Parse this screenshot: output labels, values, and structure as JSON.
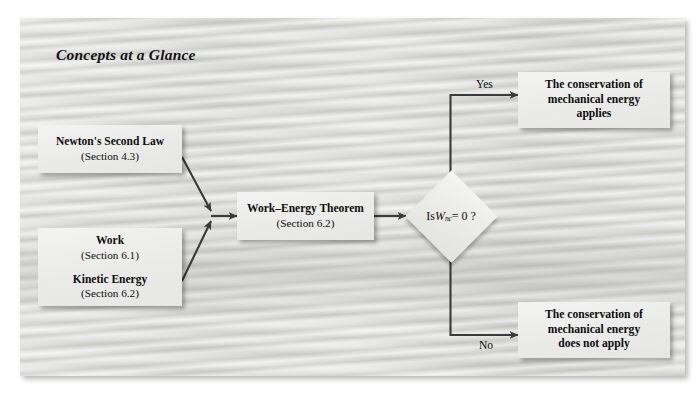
{
  "figure": {
    "title": "Concepts at a Glance",
    "background_color": "#d7d7d4",
    "node_fill_color": "#efefed",
    "line_color": "#3a3a3a"
  },
  "nodes": {
    "newtons_second_law": {
      "heading": "Newton's Second Law",
      "section": "(Section 4.3)"
    },
    "work_kinetic_energy": {
      "heading_1": "Work",
      "section_1": "(Section 6.1)",
      "heading_2": "Kinetic Energy",
      "section_2": "(Section 6.2)"
    },
    "work_energy_theorem": {
      "heading": "Work–Energy Theorem",
      "section": "(Section 6.2)"
    },
    "decision": {
      "prefix": "Is ",
      "symbol": "W",
      "subscript": "nc",
      "suffix": " = 0 ?",
      "full_text": "Is Wnc = 0 ?"
    },
    "conservation_applies": {
      "line_1": "The conservation of",
      "line_2": "mechanical energy",
      "line_3": "applies"
    },
    "conservation_not_applies": {
      "line_1": "The conservation of",
      "line_2": "mechanical energy",
      "line_3": "does not apply"
    }
  },
  "edges": {
    "yes_label": "Yes",
    "no_label": "No"
  }
}
